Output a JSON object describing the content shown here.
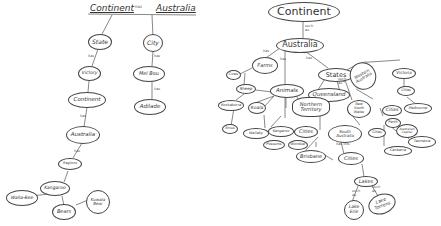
{
  "left_map": {
    "title_left": "Continent",
    "title_mid": "has",
    "title_right": "Australia",
    "nodes": [
      {
        "id": "state",
        "label": "State"
      },
      {
        "id": "city",
        "label": "City"
      },
      {
        "id": "victory",
        "label": "Victory"
      },
      {
        "id": "melbourne",
        "label": "Mel Bou"
      },
      {
        "id": "continent",
        "label": "Continent"
      },
      {
        "id": "adelaide",
        "label": "Adilade"
      },
      {
        "id": "australia",
        "label": "Australia"
      },
      {
        "id": "regions",
        "label": "Regions"
      },
      {
        "id": "kangaroo",
        "label": "Kangaroo"
      },
      {
        "id": "wallaby",
        "label": "Walla-Bee"
      },
      {
        "id": "bears",
        "label": "Bears"
      },
      {
        "id": "koala",
        "label": "Kuwala\nBear"
      }
    ],
    "link_labels": [
      "has",
      "has",
      "has",
      "has",
      "has"
    ]
  },
  "right_map": {
    "nodes": [
      {
        "id": "continent",
        "label": "Continent"
      },
      {
        "id": "australia",
        "label": "Australia"
      },
      {
        "id": "farms",
        "label": "Farms"
      },
      {
        "id": "cows",
        "label": "Cows"
      },
      {
        "id": "sheep",
        "label": "Sheep"
      },
      {
        "id": "animals",
        "label": "Animals"
      },
      {
        "id": "kookaburra",
        "label": "Kookaburra"
      },
      {
        "id": "koala",
        "label": "Koala"
      },
      {
        "id": "emus",
        "label": "Emus"
      },
      {
        "id": "wallaby",
        "label": "Wallaby"
      },
      {
        "id": "kangaroo",
        "label": "Kangaroo"
      },
      {
        "id": "possums",
        "label": "Possums"
      },
      {
        "id": "wombat",
        "label": "Wombat"
      },
      {
        "id": "states",
        "label": "States"
      },
      {
        "id": "queensland",
        "label": "Queensland"
      },
      {
        "id": "northern_territory",
        "label": "Northern\nTerritory"
      },
      {
        "id": "cities_nt",
        "label": "Cities"
      },
      {
        "id": "brisbane",
        "label": "Brisbane"
      },
      {
        "id": "western_australia",
        "label": "Western\nAustralia"
      },
      {
        "id": "victoria",
        "label": "Victoria"
      },
      {
        "id": "cities_vic",
        "label": "Cities"
      },
      {
        "id": "melbourne",
        "label": "Melbourne"
      },
      {
        "id": "new_south_wales",
        "label": "New\nSouth\nWales"
      },
      {
        "id": "cities_wa",
        "label": "Cities"
      },
      {
        "id": "perth",
        "label": "Perth"
      },
      {
        "id": "south_australia",
        "label": "South\nAustralia"
      },
      {
        "id": "cities_sa",
        "label": "Cities"
      },
      {
        "id": "cities_nsw",
        "label": "Cities"
      },
      {
        "id": "canberra",
        "label": "Canberra"
      },
      {
        "id": "act",
        "label": "Australian\nCapital"
      },
      {
        "id": "tasmania",
        "label": "Tasmania"
      },
      {
        "id": "lakes",
        "label": "Lakes"
      },
      {
        "id": "lake_erie",
        "label": "Lake\nErie"
      },
      {
        "id": "lake_torrens",
        "label": "Lake\nTorrens"
      }
    ],
    "link_labels": {
      "continent_australia": "such\nas",
      "australia_farms": "has",
      "australia_animals": "has",
      "australia_states": "has",
      "states_wa": "such\nas",
      "has": "has",
      "such_as": "such\nas",
      "has_lots": "has lots"
    }
  }
}
